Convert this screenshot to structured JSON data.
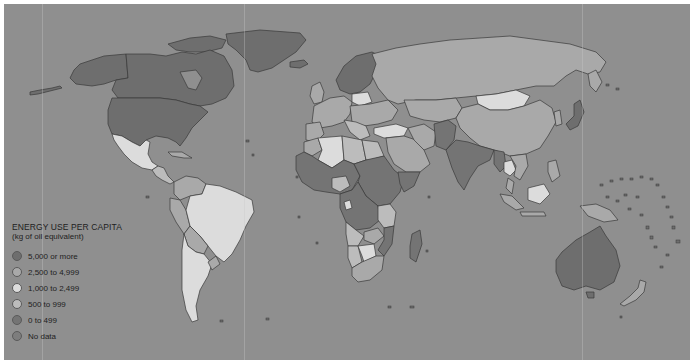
{
  "map": {
    "type": "choropleth-world-map",
    "ocean_color": "#8f8f8f",
    "border_color": "#3a3a3a"
  },
  "legend": {
    "title": "ENERGY USE PER CAPITA",
    "subtitle": "(kg of oil equivalent)",
    "items": [
      {
        "label": "5,000 or more",
        "color": "#6e6e6e"
      },
      {
        "label": "2,500 to 4,999",
        "color": "#a9a9a9"
      },
      {
        "label": "1,000 to 2,499",
        "color": "#dcdcdc"
      },
      {
        "label": "500 to 999",
        "color": "#bcbcbc"
      },
      {
        "label": "0 to 499",
        "color": "#747474"
      },
      {
        "label": "No data",
        "color": "#7d7d7d"
      }
    ]
  },
  "regions": {
    "north_america": {
      "usa": "#6e6e6e",
      "canada": "#6e6e6e",
      "alaska": "#6e6e6e",
      "greenland": "#6e6e6e",
      "mexico": "#dcdcdc",
      "central_america": "#bcbcbc",
      "caribbean": "#a9a9a9"
    },
    "south_america": {
      "brazil": "#dcdcdc",
      "argentina": "#dcdcdc",
      "chile": "#dcdcdc",
      "venezuela": "#dcdcdc",
      "colombia": "#a9a9a9",
      "peru": "#a9a9a9",
      "bolivia": "#a9a9a9",
      "paraguay": "#a9a9a9",
      "uruguay": "#a9a9a9",
      "ecuador": "#a9a9a9"
    },
    "europe": {
      "scandinavia": "#6e6e6e",
      "western": "#a9a9a9",
      "eastern": "#a9a9a9",
      "poland": "#dcdcdc",
      "iceland": "#6e6e6e"
    },
    "russia": "#a9a9a9",
    "asia": {
      "china": "#a9a9a9",
      "mongolia": "#dcdcdc",
      "india": "#747474",
      "southeast": "#a9a9a9",
      "japan": "#6e6e6e",
      "middle_east": "#a9a9a9",
      "central": "#a9a9a9",
      "pakistan_afghanistan": "#747474",
      "thailand": "#dcdcdc"
    },
    "africa": {
      "north": "#a9a9a9",
      "algeria": "#dcdcdc",
      "libya_egypt": "#bcbcbc",
      "west_central": "#747474",
      "nigeria": "#bcbcbc",
      "south_africa": "#a9a9a9",
      "southern": "#bcbcbc",
      "madagascar": "#747474",
      "east": "#747474"
    },
    "oceania": {
      "australia": "#6e6e6e",
      "new_zealand": "#a9a9a9",
      "papua": "#a9a9a9",
      "indonesia": "#a9a9a9"
    }
  }
}
